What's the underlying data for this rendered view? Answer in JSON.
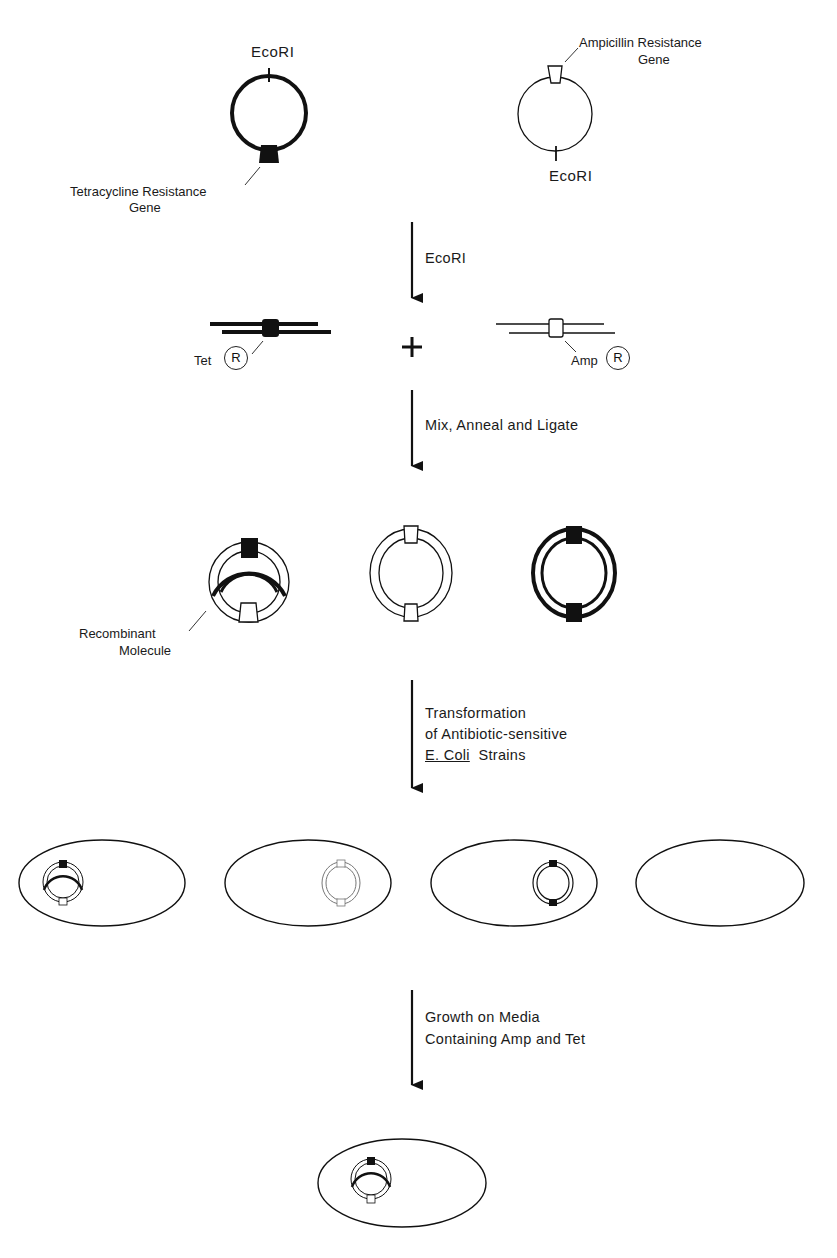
{
  "plasmids": {
    "tet_plasmid": {
      "site_label": "EcoRI",
      "gene_label_line1": "Tetracycline Resistance",
      "gene_label_line2": "Gene"
    },
    "amp_plasmid": {
      "site_label": "EcoRI",
      "gene_label_line1": "Ampicillin Resistance",
      "gene_label_line2": "Gene"
    }
  },
  "steps": [
    {
      "label_lines": [
        "EcoRI"
      ]
    },
    {
      "label_lines": [
        "Mix, Anneal and Ligate"
      ]
    },
    {
      "label_lines": [
        "Transformation",
        "of Antibiotic-sensitive"
      ],
      "last_line_italic_part": "E. Coli",
      "last_line_rest": "Strains"
    },
    {
      "label_lines": [
        "Growth on Media",
        "Containing Amp and Tet"
      ]
    }
  ],
  "fragments": {
    "tet": {
      "name": "Tet",
      "marker": "R"
    },
    "plus": "+",
    "amp": {
      "name": "Amp",
      "marker": "R"
    }
  },
  "ligation_products": {
    "recombinant_label_line1": "Recombinant",
    "recombinant_label_line2": "Molecule"
  },
  "colors": {
    "ink": "#111111",
    "background": "#ffffff"
  }
}
